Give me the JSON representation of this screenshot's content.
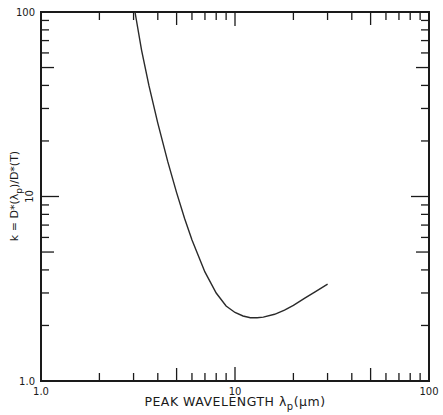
{
  "chart_data": {
    "type": "line",
    "title": "",
    "xlabel": "PEAK WAVELENGTH λp(μm)",
    "xlabel_parts": {
      "main": "PEAK WAVELENGTH λ",
      "sub": "p",
      "unit": "(μm)"
    },
    "ylabel": "k = D*(λp)/D*(T)",
    "ylabel_parts": {
      "pre": "k = D*(λ",
      "sub": "p",
      "post": ")/D*(T)"
    },
    "xscale": "log",
    "yscale": "log",
    "xlim": [
      1.0,
      100
    ],
    "ylim": [
      1.0,
      100
    ],
    "x_tick_labels": [
      "1.0",
      "10",
      "100"
    ],
    "y_tick_labels": [
      "1.0",
      "10",
      "100"
    ],
    "grid": false,
    "legend": null,
    "series": [
      {
        "name": "k vs peak wavelength",
        "x": [
          3.05,
          3.3,
          3.6,
          4.0,
          4.5,
          5.0,
          5.5,
          6.0,
          7.0,
          8.0,
          9.0,
          10.0,
          11.0,
          12.0,
          13.0,
          14.0,
          16.0,
          18.0,
          20.0,
          23.0,
          26.0,
          30.0
        ],
        "y": [
          100,
          62,
          40,
          25,
          15.5,
          10.5,
          7.6,
          5.8,
          3.9,
          3.0,
          2.55,
          2.35,
          2.25,
          2.2,
          2.2,
          2.22,
          2.3,
          2.42,
          2.57,
          2.82,
          3.05,
          3.35
        ]
      }
    ]
  },
  "frame": {
    "left": 41,
    "right": 429,
    "top": 12,
    "bottom": 381,
    "line_color": "#1a1a1a"
  }
}
